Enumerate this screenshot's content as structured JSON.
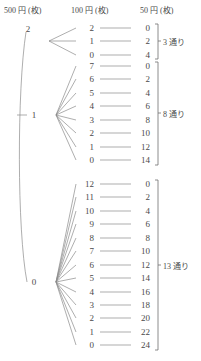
{
  "headers": {
    "col1": "500 円 (枚)",
    "col2": "100 円 (枚)",
    "col3": "50 円 (枚)"
  },
  "branches": [
    {
      "root": "2",
      "count_label": "3 通り",
      "rows": [
        {
          "c100": "2",
          "c50": "0"
        },
        {
          "c100": "1",
          "c50": "2"
        },
        {
          "c100": "0",
          "c50": "4"
        }
      ]
    },
    {
      "root": "1",
      "count_label": "8 通り",
      "rows": [
        {
          "c100": "7",
          "c50": "0"
        },
        {
          "c100": "6",
          "c50": "2"
        },
        {
          "c100": "5",
          "c50": "4"
        },
        {
          "c100": "4",
          "c50": "6"
        },
        {
          "c100": "3",
          "c50": "8"
        },
        {
          "c100": "2",
          "c50": "10"
        },
        {
          "c100": "1",
          "c50": "12"
        },
        {
          "c100": "0",
          "c50": "14"
        }
      ]
    },
    {
      "root": "0",
      "count_label": "13 通り",
      "rows": [
        {
          "c100": "12",
          "c50": "0"
        },
        {
          "c100": "11",
          "c50": "2"
        },
        {
          "c100": "10",
          "c50": "4"
        },
        {
          "c100": "9",
          "c50": "6"
        },
        {
          "c100": "8",
          "c50": "8"
        },
        {
          "c100": "7",
          "c50": "10"
        },
        {
          "c100": "6",
          "c50": "12"
        },
        {
          "c100": "5",
          "c50": "14"
        },
        {
          "c100": "4",
          "c50": "16"
        },
        {
          "c100": "3",
          "c50": "18"
        },
        {
          "c100": "2",
          "c50": "20"
        },
        {
          "c100": "1",
          "c50": "22"
        },
        {
          "c100": "0",
          "c50": "24"
        }
      ]
    }
  ],
  "colors": {
    "ink": "#4a4a4a",
    "line": "#8b8b8b",
    "background": "#ffffff"
  }
}
